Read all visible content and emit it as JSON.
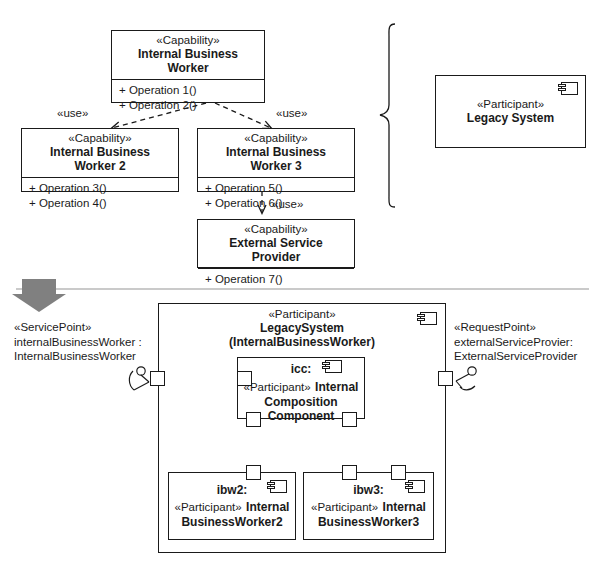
{
  "diagram": {
    "top_section": {
      "classes": [
        {
          "id": "ibw",
          "stereotype": "«Capability»",
          "name": "Internal Business Worker",
          "operations": [
            "+ Operation 1()",
            "+ Operation 2()"
          ]
        },
        {
          "id": "ibw2",
          "stereotype": "«Capability»",
          "name": "Internal Business Worker 2",
          "operations": [
            "+ Operation 3()",
            "+ Operation 4()"
          ]
        },
        {
          "id": "ibw3",
          "stereotype": "«Capability»",
          "name": "Internal Business Worker 3",
          "operations": [
            "+ Operation 5()",
            "+ Operation 6()"
          ]
        },
        {
          "id": "esp",
          "stereotype": "«Capability»",
          "name": "External Service Provider",
          "operations": [
            "+ Operation 7()"
          ]
        }
      ],
      "dependencies": [
        {
          "from": "ibw",
          "to": "ibw2",
          "label": "«use»"
        },
        {
          "from": "ibw",
          "to": "ibw3",
          "label": "«use»"
        },
        {
          "from": "ibw3",
          "to": "esp",
          "label": "«use»"
        }
      ],
      "component": {
        "id": "legacy-system",
        "stereotype": "«Participant»",
        "name": "Legacy System"
      }
    },
    "transform_arrow": {
      "direction": "down",
      "color": "#808080"
    },
    "bottom_section": {
      "outer_component": {
        "id": "legacy-system-instance",
        "stereotype": "«Participant»",
        "name": "LegacySystem",
        "realizes": "(InternalBusinessWorker)"
      },
      "inner_component": {
        "id": "icc",
        "instance": "icc:",
        "stereotype": "«Participant»",
        "name_line1": "Internal",
        "name_line2": "Composition",
        "name_line3": "Component"
      },
      "parts": [
        {
          "id": "ibw2-part",
          "instance": "ibw2:",
          "stereotype": "«Participant»",
          "name_line1": "Internal",
          "name_line2": "BusinessWorker2"
        },
        {
          "id": "ibw3-part",
          "instance": "ibw3:",
          "stereotype": "«Participant»",
          "name_line1": "Internal",
          "name_line2": "BusinessWorker3"
        }
      ],
      "service_point": {
        "stereotype": "«ServicePoint»",
        "instance": "internalBusinessWorker :",
        "type": "InternalBusinessWorker"
      },
      "request_point": {
        "stereotype": "«RequestPoint»",
        "instance": "externalServiceProvier:",
        "type": "ExternalServiceProvider"
      }
    }
  }
}
